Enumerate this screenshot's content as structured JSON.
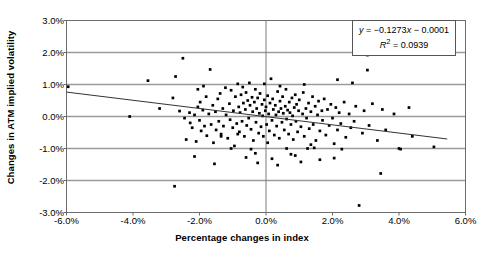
{
  "chart_data": {
    "type": "scatter",
    "title": "",
    "xlabel": "Percentage changes in index",
    "ylabel": "Changes in ATM implied volatility",
    "xlim": [
      -6.0,
      6.0
    ],
    "ylim": [
      -3.0,
      3.0
    ],
    "xticks": [
      -6.0,
      -4.0,
      -2.0,
      0.0,
      2.0,
      4.0,
      6.0
    ],
    "yticks": [
      3.0,
      2.0,
      1.0,
      0.0,
      -1.0,
      -2.0,
      -3.0
    ],
    "xtick_labels": [
      "-6.0%",
      "-4.0%",
      "-2.0%",
      "0.0%",
      "2.0%",
      "4.0%",
      "6.0%"
    ],
    "ytick_labels": [
      "3.0%",
      "2.0%",
      "1.0%",
      "0.0%",
      "-1.0%",
      "-2.0%",
      "-3.0%"
    ],
    "grid": "horizontal",
    "legend": "none",
    "marker": "filled-square-dot",
    "marker_color": "#000000",
    "annotation": {
      "equation": "y = −0.1273x − 0.0001",
      "equation_y": "y",
      "equation_rest": " = −0.1273",
      "equation_x": "x",
      "equation_tail": " − 0.0001",
      "r_squared_label": "R",
      "r_squared_exp": "2",
      "r_squared_value": " = 0.0939",
      "slope": -0.1273,
      "intercept": -0.0001,
      "r_squared": 0.0939
    },
    "trendline": {
      "x_start": -6.0,
      "y_start": 0.763,
      "x_end": 5.45,
      "y_end": -0.703,
      "color": "#333333"
    },
    "points": [
      [
        -5.95,
        0.93
      ],
      [
        -4.1,
        0.0
      ],
      [
        -3.55,
        1.12
      ],
      [
        -3.2,
        0.25
      ],
      [
        -2.8,
        0.58
      ],
      [
        -2.72,
        1.25
      ],
      [
        -2.6,
        0.17
      ],
      [
        -2.5,
        1.82
      ],
      [
        -2.45,
        -0.05
      ],
      [
        -2.4,
        -0.72
      ],
      [
        -2.3,
        0.12
      ],
      [
        -2.28,
        -0.2
      ],
      [
        -2.22,
        -0.35
      ],
      [
        -2.15,
        0.05
      ],
      [
        -2.1,
        -0.78
      ],
      [
        -2.05,
        0.3
      ],
      [
        -2.0,
        -0.12
      ],
      [
        -1.98,
        0.45
      ],
      [
        -1.95,
        -0.45
      ],
      [
        -1.9,
        0.2
      ],
      [
        -1.85,
        -0.3
      ],
      [
        -1.8,
        0.62
      ],
      [
        -1.78,
        -0.6
      ],
      [
        -1.72,
        0.08
      ],
      [
        -1.68,
        1.47
      ],
      [
        -1.65,
        -0.25
      ],
      [
        -1.6,
        0.35
      ],
      [
        -1.58,
        -0.82
      ],
      [
        -1.52,
        0.15
      ],
      [
        -1.5,
        -0.42
      ],
      [
        -1.45,
        0.55
      ],
      [
        -1.42,
        -0.15
      ],
      [
        -1.38,
        0.72
      ],
      [
        -1.35,
        -0.55
      ],
      [
        -1.3,
        0.25
      ],
      [
        -1.28,
        -0.3
      ],
      [
        -1.22,
        0.9
      ],
      [
        -1.2,
        0.05
      ],
      [
        -1.15,
        -0.68
      ],
      [
        -1.1,
        0.4
      ],
      [
        -1.08,
        -0.1
      ],
      [
        -1.05,
        0.82
      ],
      [
        -1.0,
        -0.35
      ],
      [
        -0.98,
        0.18
      ],
      [
        -0.95,
        -0.92
      ],
      [
        -0.92,
        0.62
      ],
      [
        -0.88,
        -0.22
      ],
      [
        -0.85,
        1.02
      ],
      [
        -0.82,
        0.3
      ],
      [
        -0.8,
        -0.48
      ],
      [
        -0.78,
        0.12
      ],
      [
        -0.75,
        0.68
      ],
      [
        -0.72,
        -0.15
      ],
      [
        -0.7,
        0.92
      ],
      [
        -0.68,
        0.42
      ],
      [
        -0.65,
        -0.62
      ],
      [
        -0.62,
        0.22
      ],
      [
        -0.6,
        0.75
      ],
      [
        -0.58,
        -0.28
      ],
      [
        -0.55,
        0.5
      ],
      [
        -0.52,
        -0.05
      ],
      [
        -0.5,
        1.05
      ],
      [
        -0.48,
        0.35
      ],
      [
        -0.45,
        -0.4
      ],
      [
        -0.42,
        0.6
      ],
      [
        -0.4,
        0.15
      ],
      [
        -0.38,
        -0.75
      ],
      [
        -0.35,
        0.45
      ],
      [
        -0.32,
        0.85
      ],
      [
        -0.3,
        -0.18
      ],
      [
        -0.28,
        0.25
      ],
      [
        -0.25,
        0.58
      ],
      [
        -0.22,
        -0.52
      ],
      [
        -0.2,
        0.1
      ],
      [
        -0.18,
        0.72
      ],
      [
        -0.15,
        -0.32
      ],
      [
        -0.12,
        0.38
      ],
      [
        -0.1,
        0.02
      ],
      [
        -0.08,
        -0.62
      ],
      [
        -0.05,
        0.52
      ],
      [
        -0.02,
        0.18
      ],
      [
        0.0,
        0.3
      ],
      [
        0.02,
        -0.25
      ],
      [
        0.05,
        0.65
      ],
      [
        0.08,
        0.08
      ],
      [
        0.1,
        -0.45
      ],
      [
        0.12,
        0.42
      ],
      [
        0.15,
        1.18
      ],
      [
        0.18,
        -0.12
      ],
      [
        0.2,
        0.55
      ],
      [
        0.22,
        0.22
      ],
      [
        0.25,
        -0.58
      ],
      [
        0.28,
        0.35
      ],
      [
        0.3,
        0.05
      ],
      [
        0.32,
        -0.3
      ],
      [
        0.35,
        0.78
      ],
      [
        0.38,
        0.15
      ],
      [
        0.4,
        -0.68
      ],
      [
        0.42,
        0.48
      ],
      [
        0.45,
        0.25
      ],
      [
        0.48,
        -0.18
      ],
      [
        0.5,
        0.62
      ],
      [
        0.52,
        0.1
      ],
      [
        0.55,
        -0.42
      ],
      [
        0.58,
        0.32
      ],
      [
        0.6,
        0.85
      ],
      [
        0.62,
        -0.08
      ],
      [
        0.65,
        0.2
      ],
      [
        0.68,
        -0.55
      ],
      [
        0.7,
        0.45
      ],
      [
        0.72,
        0.12
      ],
      [
        0.75,
        -0.25
      ],
      [
        0.78,
        0.58
      ],
      [
        0.8,
        0.02
      ],
      [
        0.82,
        -0.72
      ],
      [
        0.85,
        0.28
      ],
      [
        0.88,
        0.68
      ],
      [
        0.9,
        -0.15
      ],
      [
        0.92,
        0.38
      ],
      [
        0.95,
        -0.48
      ],
      [
        0.98,
        0.18
      ],
      [
        1.0,
        0.52
      ],
      [
        1.05,
        -0.32
      ],
      [
        1.1,
        0.08
      ],
      [
        1.12,
        0.75
      ],
      [
        1.15,
        -0.62
      ],
      [
        1.2,
        0.25
      ],
      [
        1.22,
        -0.05
      ],
      [
        1.28,
        0.42
      ],
      [
        1.3,
        -0.38
      ],
      [
        1.35,
        0.15
      ],
      [
        1.4,
        0.62
      ],
      [
        1.42,
        -0.25
      ],
      [
        1.48,
        0.32
      ],
      [
        1.5,
        -0.75
      ],
      [
        1.55,
        0.05
      ],
      [
        1.58,
        0.48
      ],
      [
        1.62,
        -0.45
      ],
      [
        1.68,
        0.18
      ],
      [
        1.7,
        -0.12
      ],
      [
        1.75,
        0.55
      ],
      [
        1.8,
        -0.58
      ],
      [
        1.85,
        0.22
      ],
      [
        1.9,
        -0.28
      ],
      [
        1.95,
        0.38
      ],
      [
        2.0,
        -0.05
      ],
      [
        2.05,
        -0.85
      ],
      [
        2.1,
        0.28
      ],
      [
        2.15,
        -0.42
      ],
      [
        2.2,
        0.12
      ],
      [
        2.25,
        -0.22
      ],
      [
        2.35,
        0.45
      ],
      [
        2.4,
        -0.65
      ],
      [
        2.5,
        0.08
      ],
      [
        2.55,
        -0.35
      ],
      [
        2.6,
        1.05
      ],
      [
        2.65,
        -0.15
      ],
      [
        2.7,
        0.32
      ],
      [
        2.8,
        -2.78
      ],
      [
        2.9,
        -0.52
      ],
      [
        2.95,
        0.18
      ],
      [
        3.05,
        1.92
      ],
      [
        3.1,
        -0.28
      ],
      [
        3.2,
        0.4
      ],
      [
        3.35,
        -0.75
      ],
      [
        3.45,
        -1.78
      ],
      [
        3.5,
        0.22
      ],
      [
        3.6,
        -0.42
      ],
      [
        3.85,
        0.08
      ],
      [
        4.0,
        -1.0
      ],
      [
        4.05,
        -1.02
      ],
      [
        4.3,
        0.28
      ],
      [
        4.4,
        -0.62
      ],
      [
        5.05,
        -0.95
      ],
      [
        -2.75,
        -2.18
      ],
      [
        -1.05,
        -1.0
      ],
      [
        -0.45,
        -1.02
      ],
      [
        0.62,
        -1.0
      ],
      [
        1.25,
        -1.0
      ],
      [
        1.45,
        -0.98
      ],
      [
        2.28,
        -1.02
      ],
      [
        -1.55,
        -1.48
      ],
      [
        -0.25,
        -1.45
      ],
      [
        0.35,
        -1.52
      ],
      [
        1.05,
        -1.42
      ],
      [
        1.62,
        -1.35
      ],
      [
        -2.15,
        -1.25
      ],
      [
        -0.6,
        -1.28
      ],
      [
        0.18,
        -1.32
      ],
      [
        0.88,
        -1.22
      ],
      [
        2.05,
        -1.3
      ],
      [
        -1.35,
        -0.62
      ],
      [
        -0.05,
        1.02
      ],
      [
        0.42,
        0.95
      ],
      [
        1.15,
        1.0
      ],
      [
        -1.88,
        0.95
      ],
      [
        2.15,
        1.15
      ],
      [
        0.05,
        -0.82
      ],
      [
        -0.85,
        -0.55
      ],
      [
        1.35,
        -0.88
      ],
      [
        -2.05,
        0.85
      ],
      [
        3.05,
        1.45
      ],
      [
        -0.32,
        -1.15
      ],
      [
        0.75,
        -1.18
      ]
    ]
  }
}
